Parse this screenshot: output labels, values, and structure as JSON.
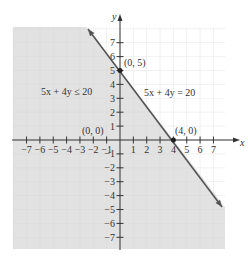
{
  "chart_data": {
    "type": "line",
    "title": "",
    "xlabel": "x",
    "ylabel": "y",
    "xlim": [
      -8,
      8
    ],
    "ylim": [
      -8,
      8
    ],
    "grid": true,
    "x_ticks": [
      -7,
      -6,
      -5,
      -4,
      -3,
      -2,
      -1,
      1,
      2,
      3,
      4,
      5,
      6,
      7
    ],
    "y_ticks": [
      -7,
      -6,
      -5,
      -4,
      -3,
      -2,
      -1,
      1,
      2,
      3,
      4,
      5,
      6,
      7
    ],
    "x_tick_labels": [
      "−7",
      "−6",
      "−5",
      "−4",
      "−3",
      "−2",
      "−1",
      "1",
      "2",
      "3",
      "4",
      "5",
      "6",
      "7"
    ],
    "y_tick_labels": [
      "−7",
      "−6",
      "−5",
      "−4",
      "−3",
      "−2",
      "−1",
      "1",
      "2",
      "3",
      "4",
      "5",
      "6",
      "7"
    ],
    "series": [
      {
        "name": "5x + 4y = 20",
        "type": "line",
        "points": [
          [
            -2.4,
            8
          ],
          [
            4,
            0
          ],
          [
            7.6,
            -4.5
          ]
        ],
        "color": "#555555"
      }
    ],
    "shaded_region": {
      "label": "5x + 4y ≤ 20",
      "side": "below-left of line",
      "color": "#e2e2e2"
    },
    "points": [
      {
        "label": "(0, 5)",
        "x": 0,
        "y": 5,
        "marked": true
      },
      {
        "label": "(4, 0)",
        "x": 4,
        "y": 0,
        "marked": true
      },
      {
        "label": "(0, 0)",
        "x": 0,
        "y": 0,
        "marked": false
      }
    ],
    "annotations": [
      {
        "text": "5x + 4y ≤ 20",
        "x": -5,
        "y": 3.5
      },
      {
        "text": "5x + 4y = 20",
        "x": 3.2,
        "y": 3.4
      }
    ]
  },
  "labels": {
    "inequality": "5x + 4y ≤ 20",
    "equation": "5x + 4y = 20",
    "point_y_intercept": "(0, 5)",
    "point_x_intercept": "(4, 0)",
    "point_origin": "(0, 0)",
    "x_axis": "x",
    "y_axis": "y"
  },
  "colors": {
    "shade": "#e2e2e2",
    "grid_shaded": "#f4f4f4",
    "grid_unshaded": "#eeeeee",
    "line": "#555555",
    "axis": "#333333"
  }
}
